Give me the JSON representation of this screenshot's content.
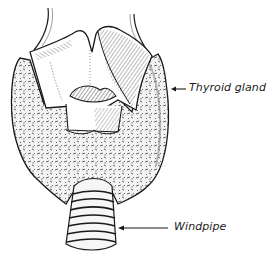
{
  "figure": {
    "labels": [
      {
        "id": "thyroid",
        "text": "Thyroid gland",
        "arrow_points_to": "thyroid-gland"
      },
      {
        "id": "windpipe",
        "text": "Windpipe",
        "arrow_points_to": "windpipe"
      }
    ],
    "colors": {
      "ink": "#1a1a1a",
      "background": "#ffffff",
      "gland_fill": "#ececec"
    }
  }
}
